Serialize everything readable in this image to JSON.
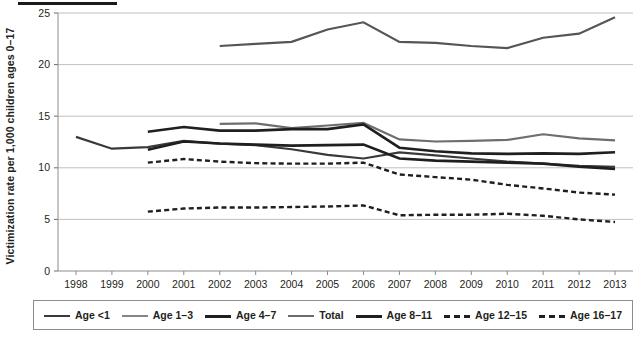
{
  "chart_data": {
    "type": "line",
    "title": "",
    "xlabel": "",
    "ylabel": "Victimization rate per 1,000 children ages 0–17",
    "x": [
      1998,
      1999,
      2000,
      2001,
      2002,
      2003,
      2004,
      2005,
      2006,
      2007,
      2008,
      2009,
      2010,
      2011,
      2012,
      2013
    ],
    "xtick_labels": [
      "1998",
      "1999",
      "2000",
      "2001",
      "2002",
      "2003",
      "2004",
      "2005",
      "2006",
      "2007",
      "2008",
      "2009",
      "2010",
      "2011",
      "2012",
      "2013"
    ],
    "ytick_labels": [
      "0",
      "5",
      "10",
      "15",
      "20",
      "25"
    ],
    "yticks": [
      0,
      5,
      10,
      15,
      20,
      25
    ],
    "ylim": [
      0,
      25
    ],
    "grid": "horizontal",
    "legend_position": "bottom",
    "series": [
      {
        "name": "Age <1",
        "style": "solid",
        "width": 2.2,
        "color": "#3a3a3a",
        "values": [
          13.0,
          11.85,
          12.0,
          12.6,
          12.35,
          12.2,
          11.8,
          11.25,
          10.9,
          11.5,
          11.2,
          10.9,
          10.6,
          10.4,
          10.2,
          10.1
        ]
      },
      {
        "name": "Age 1–3",
        "style": "solid",
        "width": 2.2,
        "color": "#6e6e6e",
        "values": [
          null,
          null,
          null,
          null,
          14.25,
          14.3,
          13.85,
          14.1,
          14.35,
          12.75,
          12.55,
          12.6,
          12.7,
          13.25,
          12.85,
          12.65
        ]
      },
      {
        "name": "Age 4–7",
        "style": "solid",
        "width": 2.6,
        "color": "#1f1f1f",
        "values": [
          null,
          null,
          13.5,
          13.95,
          13.6,
          13.6,
          13.75,
          13.75,
          14.2,
          11.95,
          11.6,
          11.4,
          11.35,
          11.4,
          11.35,
          11.5
        ]
      },
      {
        "name": "Total",
        "style": "solid",
        "width": 2.2,
        "color": "#555555",
        "values": [
          null,
          null,
          null,
          null,
          21.8,
          22.0,
          22.2,
          23.4,
          24.1,
          22.2,
          22.1,
          21.8,
          21.6,
          22.6,
          23.0,
          24.6
        ]
      },
      {
        "name": "Age 8–11",
        "style": "solid",
        "width": 2.6,
        "color": "#1f1f1f",
        "values": [
          null,
          null,
          11.75,
          12.55,
          12.35,
          12.25,
          12.15,
          12.2,
          12.25,
          10.9,
          10.7,
          10.6,
          10.5,
          10.4,
          10.1,
          9.9
        ]
      },
      {
        "name": "Age 12–15",
        "style": "dashed",
        "width": 2.4,
        "color": "#1f1f1f",
        "values": [
          null,
          null,
          10.5,
          10.85,
          10.6,
          10.45,
          10.4,
          10.4,
          10.5,
          9.35,
          9.1,
          8.85,
          8.35,
          8.0,
          7.6,
          7.4
        ]
      },
      {
        "name": "Age 16–17",
        "style": "dashed",
        "width": 2.4,
        "color": "#1f1f1f",
        "values": [
          null,
          null,
          5.75,
          6.05,
          6.15,
          6.15,
          6.2,
          6.25,
          6.35,
          5.4,
          5.45,
          5.45,
          5.55,
          5.35,
          5.0,
          4.75
        ]
      }
    ]
  },
  "legend": {
    "items": [
      {
        "label": "Age <1",
        "style": "solid",
        "color": "#3a3a3a",
        "width": 2.2
      },
      {
        "label": "Age 1–3",
        "style": "solid",
        "color": "#858585",
        "width": 2.4
      },
      {
        "label": "Age 4–7",
        "style": "solid",
        "color": "#1f1f1f",
        "width": 3.0
      },
      {
        "label": "Total",
        "style": "solid",
        "color": "#6b6b6b",
        "width": 2.4
      },
      {
        "label": "Age 8–11",
        "style": "solid",
        "color": "#1f1f1f",
        "width": 3.2
      },
      {
        "label": "Age 12–15",
        "style": "dashed",
        "color": "#1f1f1f",
        "width": 3.0
      },
      {
        "label": "Age 16–17",
        "style": "dashed",
        "color": "#1f1f1f",
        "width": 3.0
      }
    ]
  }
}
